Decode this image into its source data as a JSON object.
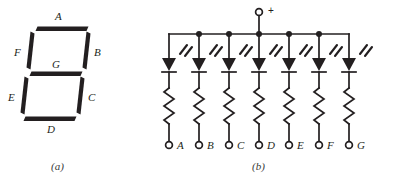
{
  "figure": {
    "ink_color": "#231f20",
    "background_color": "#ffffff",
    "panel_a": {
      "caption": "(a)",
      "description": "seven-segment-display-layout",
      "segment_labels": [
        {
          "id": "A",
          "text": "A",
          "position": "top"
        },
        {
          "id": "B",
          "text": "B",
          "position": "upper-right"
        },
        {
          "id": "C",
          "text": "C",
          "position": "lower-right"
        },
        {
          "id": "D",
          "text": "D",
          "position": "bottom"
        },
        {
          "id": "E",
          "text": "E",
          "position": "lower-left"
        },
        {
          "id": "F",
          "text": "F",
          "position": "upper-left"
        },
        {
          "id": "G",
          "text": "G",
          "position": "middle"
        }
      ]
    },
    "panel_b": {
      "caption": "(b)",
      "description": "common-anode-led-schematic",
      "supply_terminal": {
        "label": "+",
        "name": "positive-supply-terminal"
      },
      "branches": [
        {
          "id": "A",
          "terminal_label": "A",
          "has_bus_dot": false
        },
        {
          "id": "B",
          "terminal_label": "B",
          "has_bus_dot": true
        },
        {
          "id": "C",
          "terminal_label": "C",
          "has_bus_dot": true
        },
        {
          "id": "D",
          "terminal_label": "D",
          "has_bus_dot": true
        },
        {
          "id": "E",
          "terminal_label": "E",
          "has_bus_dot": true
        },
        {
          "id": "F",
          "terminal_label": "F",
          "has_bus_dot": true
        },
        {
          "id": "G",
          "terminal_label": "G",
          "has_bus_dot": false
        }
      ],
      "components_per_branch": [
        "led",
        "resistor",
        "terminal"
      ]
    }
  }
}
